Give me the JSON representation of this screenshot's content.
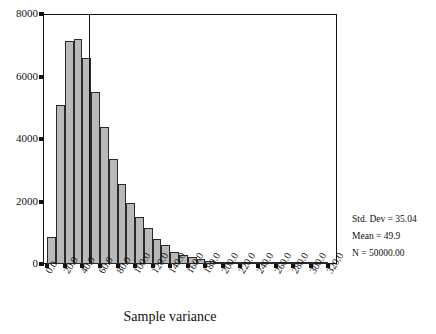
{
  "chart_data": {
    "type": "bar",
    "title": "",
    "subtitle": "",
    "xlabel": "Sample variance",
    "ylabel": "",
    "xlim": [
      -5,
      330
    ],
    "ylim": [
      0,
      8000
    ],
    "grid": false,
    "legend_position": "none",
    "bin_width": 10,
    "x_tick_labels": [
      "0.0",
      "20.0",
      "40.0",
      "60.0",
      "80.0",
      "100.0",
      "120.0",
      "140.0",
      "160.0",
      "180.0",
      "200.0",
      "220.0",
      "240.0",
      "260.0",
      "280.0",
      "300.0",
      "320.0"
    ],
    "x_tick_values": [
      0,
      20,
      40,
      60,
      80,
      100,
      120,
      140,
      160,
      180,
      200,
      220,
      240,
      260,
      280,
      300,
      320
    ],
    "y_tick_labels": [
      "0",
      "2000",
      "4000",
      "6000",
      "8000"
    ],
    "y_tick_values": [
      0,
      2000,
      4000,
      6000,
      8000
    ],
    "bin_centers": [
      5,
      15,
      25,
      35,
      45,
      55,
      65,
      75,
      85,
      95,
      105,
      115,
      125,
      135,
      145,
      155,
      165,
      175,
      185,
      195,
      205,
      215,
      225,
      235,
      245,
      255,
      265,
      275,
      285,
      295,
      305,
      315
    ],
    "values": [
      880,
      5100,
      7150,
      7200,
      6600,
      5500,
      4400,
      3350,
      2550,
      1950,
      1500,
      1150,
      800,
      620,
      400,
      300,
      210,
      150,
      105,
      75,
      55,
      40,
      28,
      20,
      14,
      10,
      7,
      5,
      4,
      3,
      2,
      1
    ],
    "reference_line": {
      "name": "mean-line",
      "x_value": 47,
      "orientation": "vertical"
    },
    "annotations": [
      "Std. Dev = 35.04",
      "Mean = 49.9",
      "N = 50000.00"
    ]
  },
  "stats": {
    "std_dev": "Std. Dev = 35.04",
    "mean": "Mean = 49.9",
    "n": "N = 50000.00"
  },
  "colors": {
    "bar_fill": "#b9b9b9",
    "bar_border": "#2a2a2a",
    "axis": "#111111",
    "background": "#ffffff"
  }
}
